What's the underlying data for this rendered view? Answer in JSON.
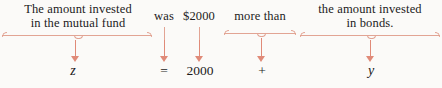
{
  "diagram": {
    "kind": "word-problem-translation",
    "accent_color": "#e08a78",
    "brace_color": "#e2a494",
    "text_color": "#1b1b1b",
    "background_color": "#fbfaf8",
    "phrases": [
      {
        "id": "phrase-mutual-fund",
        "line1": "The amount invested",
        "line2": "in the mutual fund",
        "translation": "z"
      },
      {
        "id": "phrase-was",
        "line1": "was",
        "line2": "",
        "translation": "="
      },
      {
        "id": "phrase-amount",
        "line1": "$2000",
        "line2": "",
        "translation": "2000"
      },
      {
        "id": "phrase-more-than",
        "line1": "more than",
        "line2": "",
        "translation": "+"
      },
      {
        "id": "phrase-bonds",
        "line1": "the amount invested",
        "line2": "in bonds.",
        "translation": "y"
      }
    ]
  }
}
